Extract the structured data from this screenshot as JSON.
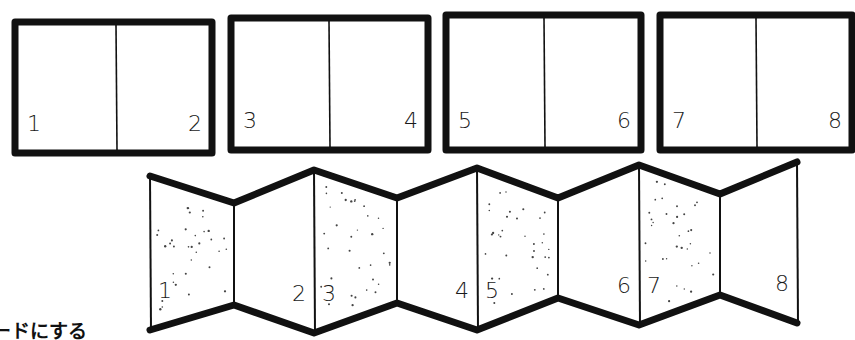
{
  "diagram": {
    "colors": {
      "ink": "#111111",
      "paper": "#ffffff",
      "stipple": "#444444"
    },
    "spreads": [
      {
        "x": 15,
        "y": 22,
        "w": 197,
        "h": 131,
        "divider_x": 116,
        "left_page": "1",
        "right_page": "2"
      },
      {
        "x": 231,
        "y": 18,
        "w": 197,
        "h": 132,
        "divider_x": 329,
        "left_page": "3",
        "right_page": "4"
      },
      {
        "x": 446,
        "y": 15,
        "w": 195,
        "h": 135,
        "divider_x": 544,
        "left_page": "5",
        "right_page": "6"
      },
      {
        "x": 660,
        "y": 15,
        "w": 192,
        "h": 135,
        "divider_x": 756,
        "left_page": "7",
        "right_page": "8"
      }
    ],
    "accordion": {
      "vertices": [
        {
          "x": 150,
          "top": 176,
          "bottom": 330
        },
        {
          "x": 234,
          "top": 203,
          "bottom": 305
        },
        {
          "x": 314,
          "top": 170,
          "bottom": 333
        },
        {
          "x": 397,
          "top": 198,
          "bottom": 303
        },
        {
          "x": 477,
          "top": 168,
          "bottom": 330
        },
        {
          "x": 558,
          "top": 198,
          "bottom": 298
        },
        {
          "x": 639,
          "top": 165,
          "bottom": 325
        },
        {
          "x": 720,
          "top": 194,
          "bottom": 295
        },
        {
          "x": 797,
          "top": 162,
          "bottom": 323
        }
      ],
      "panels": [
        {
          "page": "1",
          "shaded": true,
          "label_side": "left"
        },
        {
          "page": "2",
          "shaded": false,
          "label_side": "right"
        },
        {
          "page": "3",
          "shaded": true,
          "label_side": "left"
        },
        {
          "page": "4",
          "shaded": false,
          "label_side": "right"
        },
        {
          "page": "5",
          "shaded": true,
          "label_side": "left"
        },
        {
          "page": "6",
          "shaded": false,
          "label_side": "right"
        },
        {
          "page": "7",
          "shaded": true,
          "label_side": "left"
        },
        {
          "page": "8",
          "shaded": false,
          "label_side": "right"
        }
      ]
    },
    "caption": "ードにする"
  }
}
